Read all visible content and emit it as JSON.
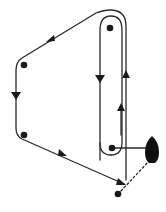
{
  "diagram": {
    "type": "route-diagram",
    "colors": {
      "line": "#2a2a2a",
      "dot": "#1a1a1a",
      "boat": "#111111",
      "background": "#ffffff"
    },
    "dots": [
      {
        "id": "top-mark",
        "x": 110,
        "y": 28
      },
      {
        "id": "left-upper-mark",
        "x": 24,
        "y": 65
      },
      {
        "id": "left-lower-mark",
        "x": 24,
        "y": 135
      },
      {
        "id": "bottom-right-mark",
        "x": 112,
        "y": 148
      },
      {
        "id": "finish-mark",
        "x": 118,
        "y": 194
      }
    ],
    "boat": {
      "x": 152,
      "y": 148
    },
    "arrows": [
      {
        "id": "arrow-top-left-diagonal",
        "direction": "down-left"
      },
      {
        "id": "arrow-left-down",
        "direction": "down"
      },
      {
        "id": "arrow-bottom-diagonal-1",
        "direction": "down-right"
      },
      {
        "id": "arrow-bottom-diagonal-2",
        "direction": "down-right"
      },
      {
        "id": "arrow-inner-down",
        "direction": "down"
      },
      {
        "id": "arrow-outer-up",
        "direction": "up"
      },
      {
        "id": "arrow-inner-up",
        "direction": "up"
      }
    ]
  }
}
